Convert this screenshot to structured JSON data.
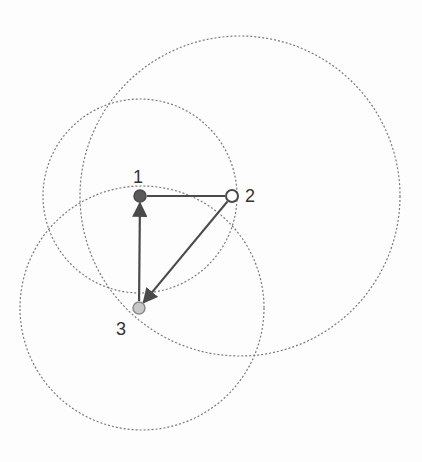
{
  "diagram": {
    "type": "directed-graph-with-range-circles",
    "nodes": [
      {
        "id": "1",
        "label": "1",
        "x": 140,
        "y": 196,
        "fill": "#5a5a5a",
        "stroke": "#4a4a4a",
        "label_x": 133,
        "label_y": 183
      },
      {
        "id": "2",
        "label": "2",
        "x": 232,
        "y": 196,
        "fill": "#ffffff",
        "stroke": "#4a4a4a",
        "label_x": 245,
        "label_y": 202
      },
      {
        "id": "3",
        "label": "3",
        "x": 139,
        "y": 308,
        "fill": "#c8c8c8",
        "stroke": "#8a8a8a",
        "label_x": 116,
        "label_y": 335
      }
    ],
    "edges": [
      {
        "from": "1",
        "to": "2",
        "arrow": false
      },
      {
        "from": "2",
        "to": "3",
        "arrow": true
      },
      {
        "from": "3",
        "to": "1",
        "arrow": true
      }
    ],
    "circles": [
      {
        "id": "A",
        "cx": 140,
        "cy": 196,
        "r": 97
      },
      {
        "id": "B",
        "cx": 240,
        "cy": 196,
        "r": 160
      },
      {
        "id": "C",
        "cx": 142,
        "cy": 308,
        "r": 122
      }
    ],
    "colors": {
      "edge": "#4a4a4a",
      "circle": "#7a7a7a",
      "label": "#333333"
    }
  }
}
